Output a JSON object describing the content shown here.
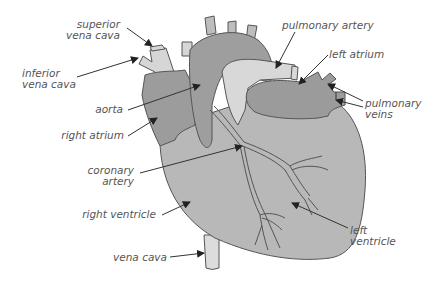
{
  "diagram": {
    "type": "anatomical-labeled-illustration",
    "colors": {
      "background": "#ffffff",
      "dark_chamber": "#9a9a9a",
      "mid_chamber": "#b5b5b5",
      "light_vessel": "#d8d8d8",
      "outline": "#555555",
      "label_text": "#555555",
      "arrow": "#333333"
    },
    "labels": {
      "superior_vena_cava": {
        "line1": "superior",
        "line2": "vena cava"
      },
      "inferior_vena_cava": {
        "line1": "inferior",
        "line2": "vena cava"
      },
      "aorta": "aorta",
      "right_atrium": "right atrium",
      "coronary_artery": {
        "line1": "coronary",
        "line2": "artery"
      },
      "right_ventricle": "right ventricle",
      "vena_cava": "vena cava",
      "pulmonary_artery": "pulmonary artery",
      "left_atrium": "left atrium",
      "pulmonary_veins": {
        "line1": "pulmonary",
        "line2": "veins"
      },
      "left_ventricle": {
        "line1": "left",
        "line2": "ventricle"
      }
    }
  }
}
